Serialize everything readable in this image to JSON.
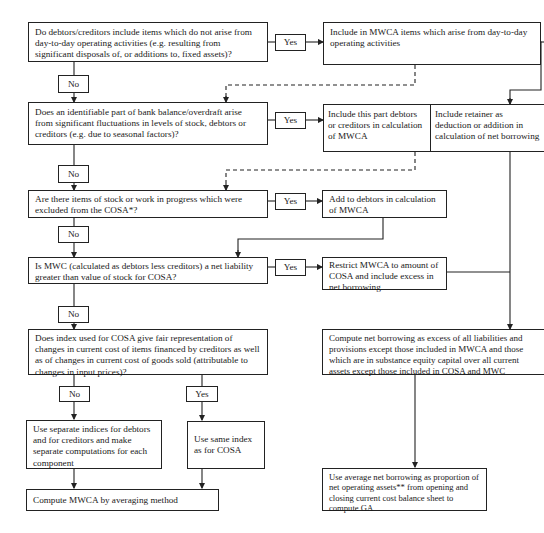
{
  "diagram": {
    "type": "flowchart",
    "questions": {
      "q1": "Do debtors/creditors include items which do not arise from day-to-day operating activities (e.g. resulting from significant disposals of, or additions to, fixed assets)?",
      "q2": "Does an identifiable part of bank balance/overdraft arise from significant fluctuations in levels of stock, debtors or creditors (e.g. due to seasonal factors)?",
      "q3": "Are there items of stock or work in progress which were excluded from the COSA*?",
      "q4": "Is MWC (calculated as debtors less creditors) a net liability greater than value of stock for COSA?",
      "q5": "Does index used for COSA give fair representation of changes in current cost of items financed by creditors as well as of changes in current cost of goods sold (attributable to changes in input prices)?"
    },
    "actions": {
      "a1": "Include in MWCA items which arise from day-to-day operating activities",
      "a2_left": "Include this part debtors or creditors in calculation of MWCA",
      "a2_right": "Include retainer as deduction or addition in calculation of net borrowing",
      "a3": "Add to debtors in calculation of MWCA",
      "a4": "Restrict MWCA to amount of COSA and include excess in net borrowing",
      "net_borrowing": "Compute net borrowing as excess of all liabilities and provisions except those included in MWCA and those which are in substance equity capital over all current assets except those included in COSA and MWC",
      "separate_indices": "Use separate indices for debtors and for creditors and make separate computations for each component",
      "same_index": "Use same index as for COSA",
      "compute_mwca": "Compute MWCA by averaging method",
      "average_net_borrowing": "Use average net borrowing as proportion of net operating assets** from opening and closing current cost balance sheet to compute GA"
    },
    "labels": {
      "yes": "Yes",
      "no": "No"
    },
    "colors": {
      "line": "#222222",
      "background": "#ffffff"
    }
  }
}
